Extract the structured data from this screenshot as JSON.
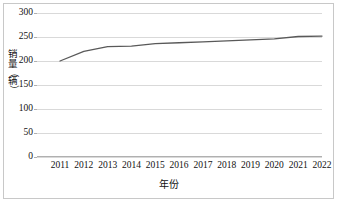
{
  "chart_data": {
    "type": "line",
    "title": "",
    "xlabel": "年份",
    "ylabel": "销量（辆）",
    "categories": [
      "2011",
      "2012",
      "2013",
      "2014",
      "2015",
      "2016",
      "2017",
      "2018",
      "2019",
      "2020",
      "2021",
      "2022"
    ],
    "series": [
      {
        "name": "销量",
        "values": [
          200,
          220,
          230,
          231,
          236,
          238,
          240,
          242,
          244,
          246,
          251,
          252
        ]
      }
    ],
    "ylim": [
      0,
      300
    ],
    "yticks": [
      0,
      50,
      100,
      150,
      200,
      250,
      300
    ],
    "ytick_labels": [
      "0",
      "50",
      "100",
      "150",
      "200",
      "250",
      "300"
    ],
    "grid": true,
    "legend": false,
    "line_color": "#595959",
    "grid_color": "#d9d9d9",
    "axis_color": "#b0b0b0",
    "border_color": "#c8c8c8",
    "text_color": "#111111"
  },
  "ylabel_chars": {
    "c1": "销",
    "c2": "量",
    "c3": "（",
    "c4": "辆",
    "c5": "）"
  }
}
